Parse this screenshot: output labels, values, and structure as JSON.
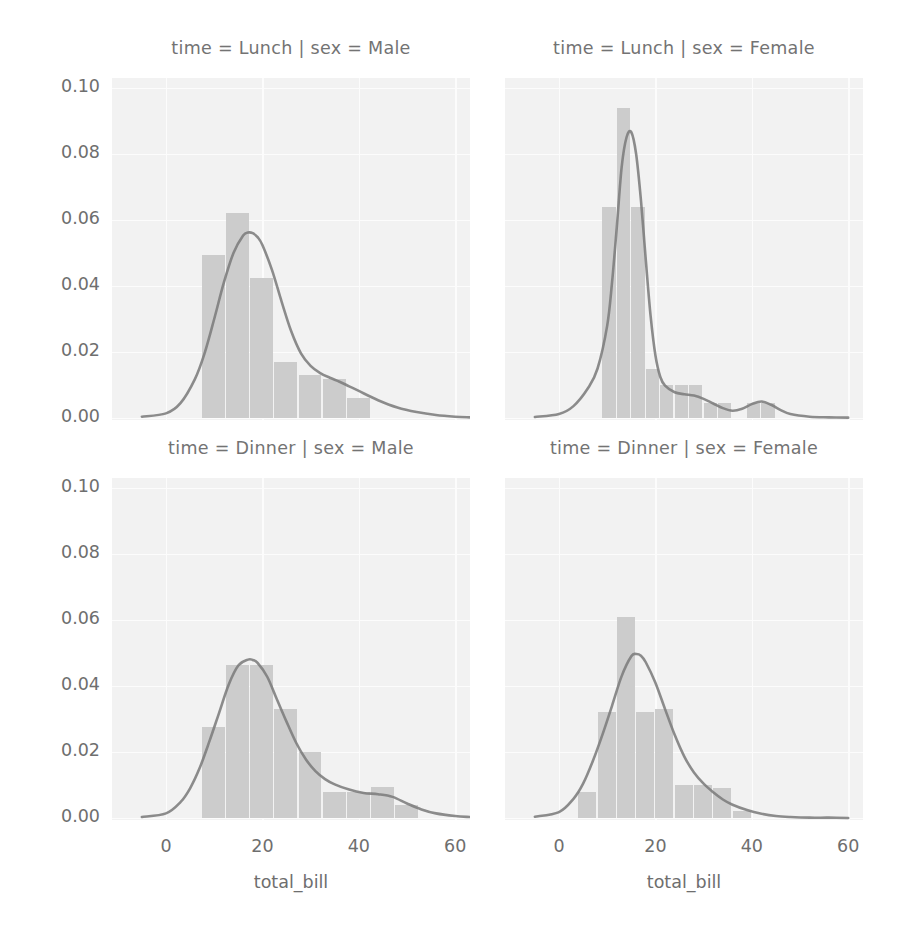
{
  "chart_data": {
    "type": "bar",
    "title": "",
    "figure_kind": "seaborn FacetGrid histogram with KDE overlay",
    "xlabel": "total_bill",
    "ylabel": "",
    "xlim": [
      -5.5,
      64.0
    ],
    "ylim": [
      0.0,
      0.108
    ],
    "xticks": [
      0,
      20,
      40,
      60
    ],
    "xtick_labels": [
      "0",
      "20",
      "40",
      "60"
    ],
    "yticks": [
      0.0,
      0.02,
      0.04,
      0.06,
      0.08,
      0.1
    ],
    "ytick_labels": [
      "0.00",
      "0.02",
      "0.04",
      "0.06",
      "0.08",
      "0.10"
    ],
    "grid": true,
    "legend": "none",
    "bar_color": "#c9c9c9",
    "line_color": "#707070",
    "panel_bg": "#f2f2f2",
    "panels": [
      {
        "row": 0,
        "col": 0,
        "title": "time = Lunch | sex = Male",
        "facet_time": "Lunch",
        "facet_sex": "Male",
        "bin_width": 5.0,
        "bin_starts": [
          7.5,
          12.5,
          17.5,
          22.5,
          27.5,
          32.5,
          37.5
        ],
        "values": [
          0.0495,
          0.062,
          0.0425,
          0.017,
          0.013,
          0.0118,
          0.006
        ],
        "kde_x": [
          -5,
          0,
          3,
          6,
          8,
          10,
          12,
          14,
          16,
          17,
          18,
          19,
          20,
          22,
          24,
          26,
          28,
          30,
          32,
          34,
          36,
          38,
          40,
          44,
          48,
          52,
          56,
          60,
          63
        ],
        "kde_y": [
          0.0004,
          0.0014,
          0.0045,
          0.0118,
          0.0196,
          0.03,
          0.041,
          0.05,
          0.0553,
          0.0562,
          0.056,
          0.0548,
          0.0524,
          0.0448,
          0.0352,
          0.0262,
          0.0196,
          0.0158,
          0.0136,
          0.0122,
          0.011,
          0.0096,
          0.0082,
          0.0054,
          0.0032,
          0.0018,
          0.0009,
          0.0004,
          0.0002
        ]
      },
      {
        "row": 0,
        "col": 1,
        "title": "time = Lunch | sex = Female",
        "facet_time": "Lunch",
        "facet_sex": "Female",
        "bin_width": 3.0,
        "bin_starts": [
          9.0,
          12.0,
          15.0,
          18.0,
          21.0,
          24.0,
          27.0,
          30.0,
          33.0,
          39.0,
          42.0
        ],
        "values": [
          0.064,
          0.094,
          0.064,
          0.015,
          0.01,
          0.01,
          0.01,
          0.0045,
          0.0045,
          0.0045,
          0.0045
        ],
        "kde_x": [
          -5,
          0,
          3,
          6,
          8,
          10,
          11,
          12,
          13,
          14,
          15,
          16,
          17,
          18,
          19,
          20,
          21,
          22,
          24,
          26,
          28,
          30,
          32,
          34,
          36,
          38,
          40,
          42,
          44,
          46,
          48,
          52,
          56,
          60
        ],
        "kde_y": [
          0.0003,
          0.0012,
          0.0036,
          0.009,
          0.015,
          0.028,
          0.041,
          0.058,
          0.076,
          0.085,
          0.0866,
          0.08,
          0.066,
          0.048,
          0.031,
          0.019,
          0.0125,
          0.0098,
          0.0078,
          0.0072,
          0.0068,
          0.0058,
          0.0044,
          0.003,
          0.0022,
          0.0028,
          0.0042,
          0.005,
          0.004,
          0.0024,
          0.0012,
          0.0004,
          0.0002,
          0.0001
        ]
      },
      {
        "row": 1,
        "col": 0,
        "title": "time = Dinner | sex = Male",
        "facet_time": "Dinner",
        "facet_sex": "Male",
        "bin_width": 5.0,
        "bin_starts": [
          7.5,
          12.5,
          17.5,
          22.5,
          27.5,
          32.5,
          37.5,
          42.5,
          47.5
        ],
        "values": [
          0.0275,
          0.0465,
          0.0465,
          0.033,
          0.02,
          0.008,
          0.008,
          0.0095,
          0.004
        ],
        "kde_x": [
          -5,
          0,
          3,
          5,
          7,
          9,
          11,
          13,
          15,
          17,
          18,
          19,
          21,
          23,
          25,
          27,
          29,
          31,
          33,
          35,
          38,
          41,
          44,
          47,
          50,
          53,
          56,
          60,
          63
        ],
        "kde_y": [
          0.0003,
          0.0014,
          0.0048,
          0.009,
          0.0152,
          0.0232,
          0.0318,
          0.0404,
          0.0462,
          0.048,
          0.0479,
          0.047,
          0.0428,
          0.036,
          0.0292,
          0.0228,
          0.0178,
          0.0142,
          0.0118,
          0.0102,
          0.0086,
          0.0076,
          0.0072,
          0.0064,
          0.0044,
          0.0026,
          0.0014,
          0.0006,
          0.0003
        ]
      },
      {
        "row": 1,
        "col": 1,
        "title": "time = Dinner | sex = Female",
        "facet_time": "Dinner",
        "facet_sex": "Female",
        "bin_width": 4.0,
        "bin_starts": [
          4.0,
          8.0,
          12.0,
          16.0,
          20.0,
          24.0,
          28.0,
          32.0,
          36.0
        ],
        "values": [
          0.008,
          0.032,
          0.061,
          0.032,
          0.033,
          0.01,
          0.01,
          0.009,
          0.002
        ],
        "kde_x": [
          -5,
          0,
          3,
          5,
          7,
          9,
          11,
          13,
          15,
          16,
          17,
          18,
          20,
          22,
          24,
          26,
          28,
          30,
          32,
          34,
          36,
          39,
          42,
          45,
          48,
          52,
          56,
          60
        ],
        "kde_y": [
          0.0004,
          0.0018,
          0.0058,
          0.0104,
          0.0172,
          0.0252,
          0.034,
          0.043,
          0.049,
          0.0497,
          0.0492,
          0.0472,
          0.041,
          0.033,
          0.0252,
          0.0186,
          0.0138,
          0.0104,
          0.0078,
          0.0056,
          0.004,
          0.0024,
          0.0013,
          0.0006,
          0.0003,
          0.0001,
          0.0001,
          0.0
        ]
      }
    ]
  },
  "axes": {
    "xlabel_left": "total_bill",
    "xlabel_right": "total_bill"
  }
}
